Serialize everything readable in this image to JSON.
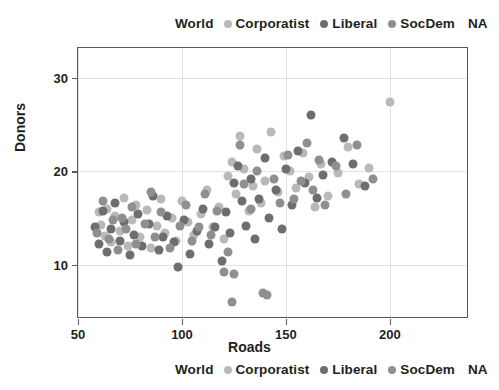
{
  "legend": {
    "title": "World",
    "entries": [
      {
        "label": "Corporatist",
        "color": "#b9b9b9"
      },
      {
        "label": "Liberal",
        "color": "#6e6e6e"
      },
      {
        "label": "SocDem",
        "color": "#8f8f8f"
      }
    ],
    "na_label": "NA"
  },
  "axes": {
    "x_title": "Roads",
    "y_title": "Donors",
    "x_ticks": [
      "50",
      "100",
      "150",
      "200"
    ],
    "y_ticks": [
      "10",
      "20",
      "30"
    ]
  },
  "chart_data": {
    "type": "scatter",
    "title": "",
    "xlabel": "Roads",
    "ylabel": "Donors",
    "xlim": [
      50,
      238
    ],
    "ylim": [
      4.2,
      33.2
    ],
    "xticks": [
      50,
      100,
      150,
      200
    ],
    "yticks": [
      10,
      20,
      30
    ],
    "grid": true,
    "legend_title": "World",
    "legend_position": "top-and-bottom-center",
    "legend_extra": "NA",
    "colors": {
      "Corporatist": "#b9b9b9",
      "Liberal": "#6e6e6e",
      "SocDem": "#8f8f8f"
    },
    "series": [
      {
        "name": "Corporatist",
        "color": "#b9b9b9",
        "points": [
          [
            60,
            15.6
          ],
          [
            61,
            14.3
          ],
          [
            63,
            13.1
          ],
          [
            64,
            16.0
          ],
          [
            66,
            12.4
          ],
          [
            68,
            15.2
          ],
          [
            70,
            13.6
          ],
          [
            72,
            17.2
          ],
          [
            74,
            12.0
          ],
          [
            76,
            14.8
          ],
          [
            78,
            16.4
          ],
          [
            80,
            13.0
          ],
          [
            83,
            15.9
          ],
          [
            85,
            11.8
          ],
          [
            88,
            14.2
          ],
          [
            90,
            17.0
          ],
          [
            92,
            13.4
          ],
          [
            95,
            15.0
          ],
          [
            97,
            12.6
          ],
          [
            100,
            16.8
          ],
          [
            103,
            14.6
          ],
          [
            106,
            13.2
          ],
          [
            109,
            15.4
          ],
          [
            112,
            18.0
          ],
          [
            115,
            14.0
          ],
          [
            118,
            16.2
          ],
          [
            120,
            12.8
          ],
          [
            122,
            19.5
          ],
          [
            124,
            21.0
          ],
          [
            126,
            17.6
          ],
          [
            128,
            23.8
          ],
          [
            130,
            20.2
          ],
          [
            132,
            15.8
          ],
          [
            134,
            18.4
          ],
          [
            136,
            22.4
          ],
          [
            138,
            16.6
          ],
          [
            140,
            19.0
          ],
          [
            143,
            24.2
          ],
          [
            146,
            17.8
          ],
          [
            149,
            21.6
          ],
          [
            152,
            20.0
          ],
          [
            155,
            18.2
          ],
          [
            158,
            22.0
          ],
          [
            161,
            19.4
          ],
          [
            164,
            16.2
          ],
          [
            167,
            20.8
          ],
          [
            170,
            17.4
          ],
          [
            175,
            19.8
          ],
          [
            180,
            22.6
          ],
          [
            185,
            18.6
          ],
          [
            190,
            20.4
          ],
          [
            200,
            27.4
          ]
        ]
      },
      {
        "name": "Liberal",
        "color": "#6e6e6e",
        "points": [
          [
            58,
            14.0
          ],
          [
            60,
            12.2
          ],
          [
            62,
            15.8
          ],
          [
            64,
            11.4
          ],
          [
            66,
            13.8
          ],
          [
            68,
            16.6
          ],
          [
            70,
            12.6
          ],
          [
            72,
            14.6
          ],
          [
            75,
            11.0
          ],
          [
            77,
            13.2
          ],
          [
            79,
            15.4
          ],
          [
            81,
            12.0
          ],
          [
            84,
            14.4
          ],
          [
            86,
            17.4
          ],
          [
            89,
            11.6
          ],
          [
            91,
            13.0
          ],
          [
            93,
            15.2
          ],
          [
            96,
            12.4
          ],
          [
            98,
            9.8
          ],
          [
            101,
            14.8
          ],
          [
            104,
            11.2
          ],
          [
            107,
            13.6
          ],
          [
            110,
            16.0
          ],
          [
            113,
            12.2
          ],
          [
            116,
            14.0
          ],
          [
            119,
            10.4
          ],
          [
            121,
            15.6
          ],
          [
            123,
            13.4
          ],
          [
            125,
            18.8
          ],
          [
            127,
            20.6
          ],
          [
            129,
            16.8
          ],
          [
            131,
            14.2
          ],
          [
            133,
            19.2
          ],
          [
            135,
            12.8
          ],
          [
            137,
            17.0
          ],
          [
            140,
            21.4
          ],
          [
            142,
            15.0
          ],
          [
            145,
            18.0
          ],
          [
            148,
            13.8
          ],
          [
            150,
            20.2
          ],
          [
            153,
            16.4
          ],
          [
            156,
            22.2
          ],
          [
            159,
            18.8
          ],
          [
            162,
            26.0
          ],
          [
            165,
            17.2
          ],
          [
            168,
            19.6
          ],
          [
            172,
            21.0
          ],
          [
            178,
            23.6
          ],
          [
            182,
            20.8
          ],
          [
            188,
            18.4
          ]
        ]
      },
      {
        "name": "SocDem",
        "color": "#8f8f8f",
        "points": [
          [
            59,
            13.4
          ],
          [
            62,
            16.8
          ],
          [
            65,
            12.8
          ],
          [
            67,
            14.8
          ],
          [
            69,
            11.6
          ],
          [
            71,
            15.0
          ],
          [
            73,
            13.8
          ],
          [
            76,
            16.2
          ],
          [
            78,
            12.2
          ],
          [
            82,
            14.4
          ],
          [
            85,
            17.8
          ],
          [
            87,
            13.0
          ],
          [
            90,
            15.6
          ],
          [
            94,
            11.8
          ],
          [
            99,
            14.2
          ],
          [
            102,
            16.4
          ],
          [
            105,
            12.6
          ],
          [
            108,
            14.0
          ],
          [
            111,
            17.6
          ],
          [
            114,
            13.2
          ],
          [
            117,
            15.8
          ],
          [
            120,
            9.2
          ],
          [
            122,
            11.4
          ],
          [
            124,
            6.0
          ],
          [
            125,
            9.0
          ],
          [
            128,
            22.8
          ],
          [
            130,
            18.6
          ],
          [
            133,
            16.0
          ],
          [
            136,
            20.0
          ],
          [
            139,
            7.0
          ],
          [
            141,
            6.8
          ],
          [
            144,
            19.2
          ],
          [
            147,
            16.6
          ],
          [
            151,
            21.8
          ],
          [
            154,
            17.0
          ],
          [
            157,
            19.0
          ],
          [
            160,
            23.0
          ],
          [
            163,
            18.0
          ],
          [
            166,
            21.2
          ],
          [
            169,
            16.4
          ],
          [
            174,
            20.6
          ],
          [
            179,
            17.6
          ],
          [
            184,
            22.8
          ],
          [
            192,
            19.2
          ]
        ]
      }
    ]
  }
}
